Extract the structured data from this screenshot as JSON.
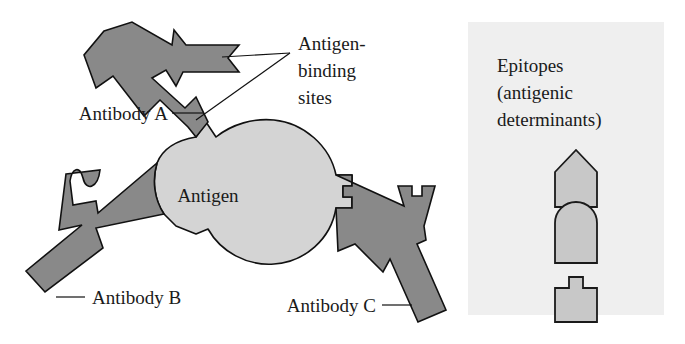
{
  "figure": {
    "labels": {
      "antigen": "Antigen",
      "antibody_a": "Antibody A",
      "antibody_b": "Antibody B",
      "antibody_c": "Antibody C",
      "binding_sites_line1": "Antigen-",
      "binding_sites_line2": "binding",
      "binding_sites_line3": "sites"
    },
    "legend": {
      "title_line1": "Epitopes",
      "title_line2": "(antigenic",
      "title_line3": "determinants)",
      "shapes": [
        {
          "name": "pentagon-epitope",
          "matches": "Antibody A"
        },
        {
          "name": "dome-epitope",
          "matches": "Antibody B"
        },
        {
          "name": "cross-top-epitope",
          "matches": "Antibody C"
        }
      ]
    },
    "colors": {
      "antibody_fill": "#898989",
      "antigen_fill": "#d4d4d4",
      "epitope_fill": "#c8c8c8",
      "outline": "#111111",
      "legend_panel_bg": "#efefef",
      "background": "#ffffff",
      "text": "#1a1a1a"
    }
  }
}
